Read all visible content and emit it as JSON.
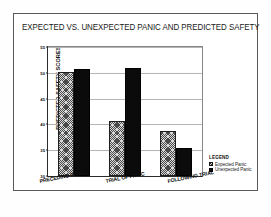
{
  "figure": {
    "title": "EXPECTED VS. UNEXPECTED PANIC AND PREDICTED SAFETY"
  },
  "legend": {
    "heading": "LEGEND",
    "entries": [
      {
        "label": "Expected Panic",
        "swatch": "hatched-gray"
      },
      {
        "label": "Unexpected Panic",
        "swatch": "solid-black"
      }
    ]
  },
  "colors": {
    "expected_panic": "#d8d8d8",
    "unexpected_panic": "#0b0b0b",
    "axis": "#2b2b2b",
    "grid": "#b4b4b4",
    "frame": "#5a5a5a"
  },
  "chart_data": {
    "type": "bar",
    "title": "EXPECTED VS. UNEXPECTED PANIC AND PREDICTED SAFETY",
    "xlabel": "",
    "ylabel": "PREDICTED SAFETY SCORES",
    "categories": [
      "PRECEDING TRIAL",
      "TRIAL OF PANIC",
      "FOLLOWING TRIAL"
    ],
    "series": [
      {
        "name": "Expected Panic",
        "values": [
          50.1,
          40.6,
          38.7
        ]
      },
      {
        "name": "Unexpected Panic",
        "values": [
          50.8,
          51.0,
          35.4
        ]
      }
    ],
    "ylim": [
      30,
      55
    ],
    "yticks": [
      30,
      35,
      40,
      45,
      50,
      55
    ],
    "ytick_labels": [
      "30",
      "35",
      "40",
      "45",
      "50",
      "55"
    ],
    "grid": true,
    "legend_position": "right"
  }
}
